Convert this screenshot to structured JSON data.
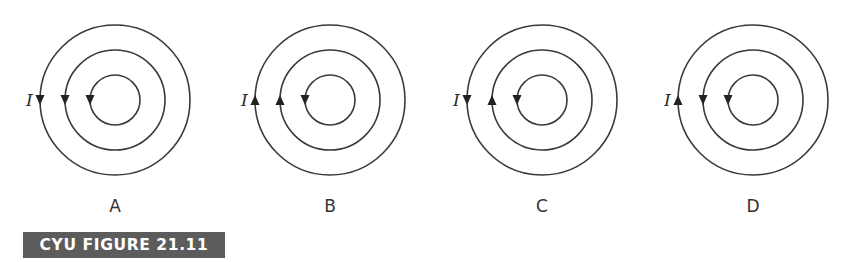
{
  "figure": {
    "caption": "CYU FIGURE 21.11",
    "caption_bg": "#5c5c5c",
    "caption_fg": "#ffffff",
    "stroke_color": "#3a3a3a",
    "current_symbol": "I",
    "radii": {
      "outer": 75,
      "middle": 50,
      "inner": 25
    },
    "panels": [
      {
        "label": "A",
        "center": [
          115,
          100
        ],
        "arrows": {
          "outer": "down",
          "middle": "down",
          "inner": "down"
        }
      },
      {
        "label": "B",
        "center": [
          330,
          100
        ],
        "arrows": {
          "outer": "up",
          "middle": "up",
          "inner": "down"
        }
      },
      {
        "label": "C",
        "center": [
          542,
          100
        ],
        "arrows": {
          "outer": "down",
          "middle": "up",
          "inner": "down"
        }
      },
      {
        "label": "D",
        "center": [
          753,
          100
        ],
        "arrows": {
          "outer": "up",
          "middle": "down",
          "inner": "down"
        }
      }
    ]
  }
}
